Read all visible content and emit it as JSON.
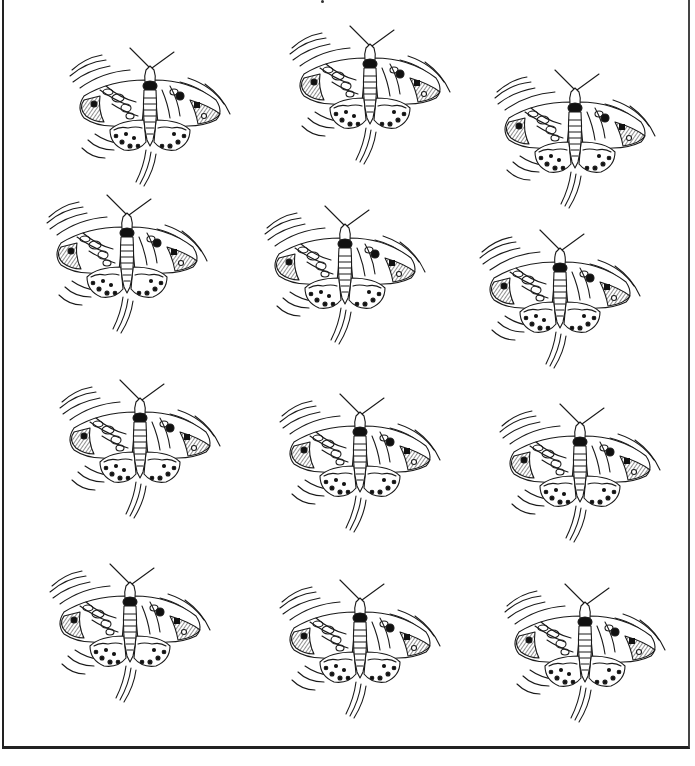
{
  "page": {
    "type": "coloring-page",
    "count": 12,
    "layout": {
      "rows": 4,
      "columns": 3
    },
    "colors": {
      "ink": "#1a1a1a",
      "paper": "#ffffff",
      "frame": "#222222"
    }
  },
  "butterflies": [
    {
      "id": 1,
      "x": 150,
      "y": 110,
      "tilt": 0
    },
    {
      "id": 2,
      "x": 370,
      "y": 88,
      "tilt": 0
    },
    {
      "id": 3,
      "x": 575,
      "y": 132,
      "tilt": 0
    },
    {
      "id": 4,
      "x": 127,
      "y": 257,
      "tilt": 0
    },
    {
      "id": 5,
      "x": 345,
      "y": 268,
      "tilt": 0
    },
    {
      "id": 6,
      "x": 560,
      "y": 292,
      "tilt": 0
    },
    {
      "id": 7,
      "x": 140,
      "y": 442,
      "tilt": 0
    },
    {
      "id": 8,
      "x": 360,
      "y": 456,
      "tilt": 0
    },
    {
      "id": 9,
      "x": 580,
      "y": 466,
      "tilt": 0
    },
    {
      "id": 10,
      "x": 130,
      "y": 626,
      "tilt": 0
    },
    {
      "id": 11,
      "x": 360,
      "y": 642,
      "tilt": 0
    },
    {
      "id": 12,
      "x": 585,
      "y": 646,
      "tilt": 0
    }
  ]
}
